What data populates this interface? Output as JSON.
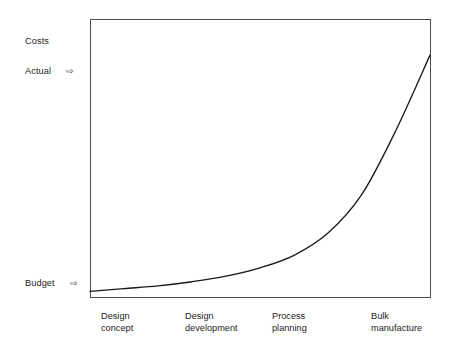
{
  "chart_data": {
    "type": "line",
    "title": "",
    "xlabel": "",
    "ylabel": "Costs",
    "grid": false,
    "legend": null,
    "categories": [
      "Design concept",
      "Design development",
      "Process planning",
      "Bulk manufacture"
    ],
    "y_axis_annotations": [
      {
        "label": "Costs",
        "position": "top"
      },
      {
        "label": "Actual",
        "position": "upper",
        "marker": "arrow-right"
      },
      {
        "label": "Budget",
        "position": "bottom",
        "marker": "arrow-right"
      }
    ],
    "series": [
      {
        "name": "Actual cost",
        "description": "Exponentially rising committed cost curve across product development phases",
        "x": [
          0,
          0.1,
          0.2,
          0.3,
          0.4,
          0.5,
          0.6,
          0.7,
          0.8,
          0.9,
          1.0
        ],
        "values": [
          0.02,
          0.03,
          0.04,
          0.055,
          0.075,
          0.105,
          0.15,
          0.23,
          0.37,
          0.6,
          0.87
        ]
      }
    ],
    "xlim": [
      0,
      1
    ],
    "ylim": [
      0,
      1
    ],
    "curve_color": "#1a1a1a",
    "frame_color": "#4d4d4d"
  },
  "labels": {
    "costs": "Costs",
    "actual": "Actual",
    "budget": "Budget",
    "x_categories": [
      {
        "line1": "Design",
        "line2": "concept"
      },
      {
        "line1": "Design",
        "line2": "development"
      },
      {
        "line1": "Process",
        "line2": "planning"
      },
      {
        "line1": "Bulk",
        "line2": "manufacture"
      }
    ]
  },
  "markers": {
    "arrow": "⇨"
  }
}
